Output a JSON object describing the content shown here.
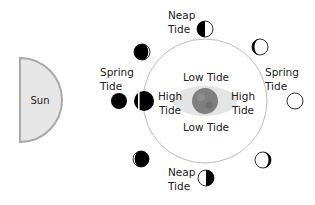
{
  "diagram": {
    "sun": {
      "label": "Sun",
      "fill": "#e6e6e6",
      "stroke": "#a9a9a9"
    },
    "earth": {
      "fill": "#7f7f7f",
      "bulge_fill": "#e4e4e4",
      "labels": {
        "low_top": "Low Tide",
        "low_bottom": "Low Tide",
        "high_left_1": "High",
        "high_left_2": "Tide",
        "high_right_1": "High",
        "high_right_2": "Tide"
      }
    },
    "orbit": {
      "stroke": "#bdbdbd"
    },
    "tide_labels": {
      "spring_left_1": "Spring",
      "spring_left_2": "Tide",
      "spring_right_1": "Spring",
      "spring_right_2": "Tide",
      "neap_top_1": "Neap",
      "neap_top_2": "Tide",
      "neap_bottom_1": "Neap",
      "neap_bottom_2": "Tide"
    },
    "moon_phases": [
      {
        "position": "left-outer",
        "phase": "new-moon"
      },
      {
        "position": "left-on-orbit",
        "phase": "new-moon"
      },
      {
        "position": "top-left",
        "phase": "waxing-crescent"
      },
      {
        "position": "top",
        "phase": "first-quarter"
      },
      {
        "position": "top-right",
        "phase": "waxing-gibbous"
      },
      {
        "position": "right",
        "phase": "full-moon"
      },
      {
        "position": "bottom-right",
        "phase": "waning-gibbous"
      },
      {
        "position": "bottom",
        "phase": "third-quarter"
      },
      {
        "position": "bottom-left",
        "phase": "waning-crescent"
      }
    ],
    "colors": {
      "dark": "#000000",
      "light": "#ffffff",
      "text": "#222222"
    }
  }
}
